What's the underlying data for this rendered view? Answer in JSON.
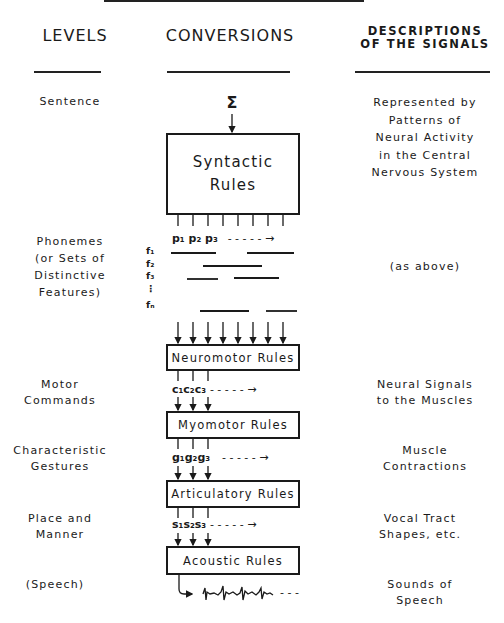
{
  "columns": {
    "levels": "LEVELS",
    "conversions": "CONVERSIONS",
    "descriptions_line1": "DESCRIPTIONS",
    "descriptions_line2": "OF THE SIGNALS"
  },
  "levels": [
    {
      "lines": [
        "Sentence"
      ]
    },
    {
      "lines": [
        "Phonemes",
        "(or Sets of",
        "Distinctive",
        "Features)"
      ]
    },
    {
      "lines": [
        "Motor",
        "Commands"
      ]
    },
    {
      "lines": [
        "Characteristic",
        "Gestures"
      ]
    },
    {
      "lines": [
        "Place and",
        "Manner"
      ]
    },
    {
      "lines": [
        "(Speech)"
      ]
    }
  ],
  "descriptions": [
    {
      "lines": [
        "Represented by",
        "Patterns of",
        "Neural Activity",
        "in the Central",
        "Nervous System"
      ]
    },
    {
      "lines": [
        "(as above)"
      ]
    },
    {
      "lines": [
        "Neural Signals",
        "to the Muscles"
      ]
    },
    {
      "lines": [
        "Muscle",
        "Contractions"
      ]
    },
    {
      "lines": [
        "Vocal Tract",
        "Shapes, etc."
      ]
    },
    {
      "lines": [
        "Sounds of",
        "Speech"
      ]
    }
  ],
  "conversions": {
    "input_symbol": "Σ",
    "boxes": [
      {
        "lines": [
          "Syntactic",
          "Rules"
        ]
      },
      {
        "lines": [
          "Neuromotor Rules"
        ]
      },
      {
        "lines": [
          "Myomotor Rules"
        ]
      },
      {
        "lines": [
          "Articulatory Rules"
        ]
      },
      {
        "lines": [
          "Acoustic Rules"
        ]
      }
    ],
    "sequences": [
      {
        "symbols": [
          "p₁",
          "p₂",
          "p₃"
        ],
        "tail": "- - - - - →"
      },
      {
        "symbols": [
          "c₁",
          "c₂",
          "c₃"
        ],
        "tail": "- - - - - →"
      },
      {
        "symbols": [
          "g₁",
          "g₂",
          "g₃"
        ],
        "tail": "- - - - - →"
      },
      {
        "symbols": [
          "s₁",
          "s₂",
          "s₃"
        ],
        "tail": "- - - - - →"
      }
    ],
    "features": [
      "f₁",
      "f₂",
      "f₃",
      "⋮",
      "fₙ"
    ],
    "waveform_tail": "- - -"
  }
}
